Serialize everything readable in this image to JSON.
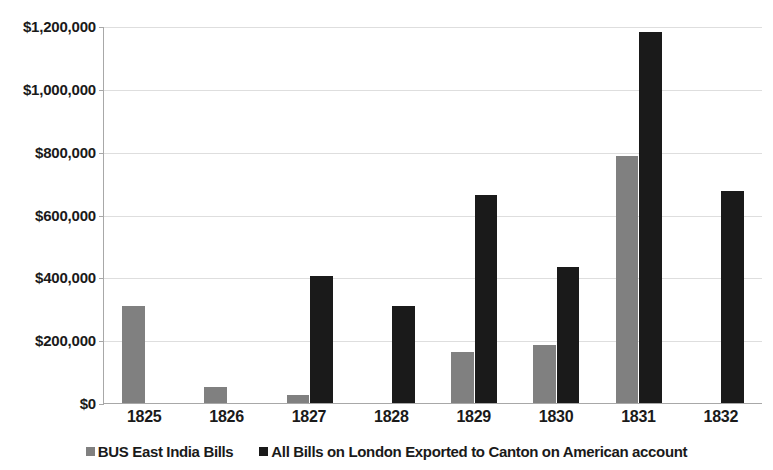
{
  "chart_data": {
    "type": "bar",
    "title": "",
    "subtitle": "",
    "xlabel": "",
    "ylabel": "",
    "categories": [
      "1825",
      "1826",
      "1827",
      "1828",
      "1829",
      "1830",
      "1831",
      "1832"
    ],
    "series": [
      {
        "name": "BUS East India Bills",
        "color": "#808080",
        "values": [
          310000,
          52000,
          25000,
          null,
          162000,
          185000,
          785000,
          null
        ]
      },
      {
        "name": "All Bills on London Exported to Canton on American account",
        "color": "#1a1a1a",
        "values": [
          null,
          null,
          405000,
          308000,
          662000,
          432000,
          1180000,
          675000
        ]
      }
    ],
    "ylim": [
      0,
      1200000
    ],
    "ytick_values": [
      0,
      200000,
      400000,
      600000,
      800000,
      1000000,
      1200000
    ],
    "ytick_labels": [
      "$0",
      "$200,000",
      "$400,000",
      "$600,000",
      "$800,000",
      "$1,000,000",
      "$1,200,000"
    ],
    "grid": true,
    "legend_position": "bottom"
  },
  "colors": {
    "series_a": "#808080",
    "series_b": "#1a1a1a",
    "gridline": "#dedede",
    "axis": "#a8a8a8",
    "background": "#ffffff",
    "text": "#1a1a1a"
  }
}
